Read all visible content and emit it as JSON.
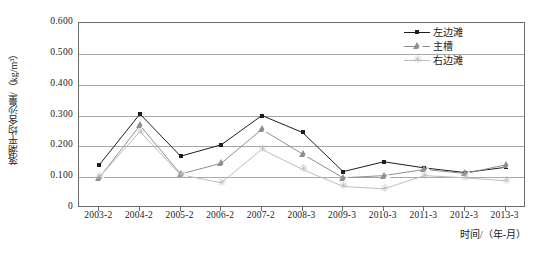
{
  "chart_data": {
    "type": "line",
    "title": "",
    "xlabel": "时间/（年-月）",
    "ylabel": "落潮平均含沙量/（kg/m³）",
    "categories": [
      "2003-2",
      "2004-2",
      "2005-2",
      "2006-2",
      "2007-2",
      "2008-3",
      "2009-3",
      "2010-3",
      "2011-3",
      "2012-3",
      "2013-3"
    ],
    "ylim": [
      0,
      0.6
    ],
    "ytick_labels": [
      "0.600",
      "0.500",
      "0.400",
      "0.300",
      "0.200",
      "0.100",
      "0"
    ],
    "ytick_values": [
      0.6,
      0.5,
      0.4,
      0.3,
      0.2,
      0.1,
      0
    ],
    "grid": true,
    "legend_position": "top-right",
    "series": [
      {
        "name": "左边滩",
        "marker": "square",
        "color": "#1d1d1d",
        "values": [
          0.14,
          0.305,
          0.168,
          0.205,
          0.3,
          0.245,
          0.118,
          0.15,
          0.13,
          0.115,
          0.132
        ]
      },
      {
        "name": "主槽",
        "marker": "triangle",
        "color": "#8f8f8f",
        "values": [
          0.098,
          0.268,
          0.11,
          0.145,
          0.255,
          0.175,
          0.098,
          0.105,
          0.125,
          0.112,
          0.14
        ]
      },
      {
        "name": "右边滩",
        "marker": "star",
        "color": "#bdbdbd",
        "values": [
          0.1,
          0.248,
          0.108,
          0.082,
          0.19,
          0.125,
          0.07,
          0.062,
          0.105,
          0.098,
          0.088
        ]
      }
    ]
  },
  "legend": {
    "items": [
      {
        "label": "左边滩"
      },
      {
        "label": "主槽"
      },
      {
        "label": "右边滩"
      }
    ]
  }
}
